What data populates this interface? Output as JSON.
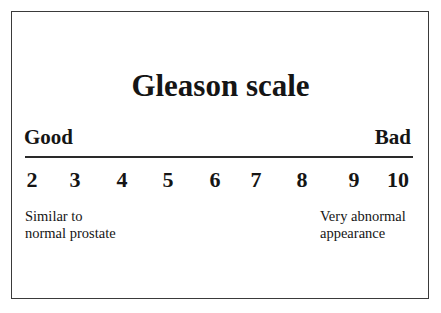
{
  "title": "Gleason scale",
  "scale": {
    "left_label": "Good",
    "right_label": "Bad",
    "values": [
      "2",
      "3",
      "4",
      "5",
      "6",
      "7",
      "8",
      "9",
      "10"
    ],
    "left_description": [
      "Similar to",
      "normal prostate"
    ],
    "right_description": [
      "Very abnormal",
      "appearance"
    ]
  }
}
